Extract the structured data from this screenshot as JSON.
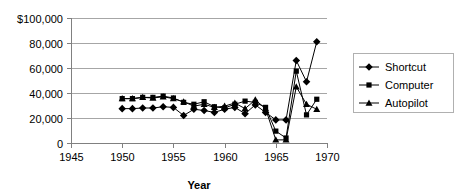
{
  "chart_data": {
    "type": "line",
    "title": "",
    "xlabel": "Year",
    "ylabel": "",
    "xlim": [
      1945,
      1970
    ],
    "ylim": [
      0,
      100000
    ],
    "grid": true,
    "legend_position": "right",
    "x": [
      1950,
      1951,
      1952,
      1953,
      1954,
      1955,
      1956,
      1957,
      1958,
      1959,
      1960,
      1961,
      1962,
      1963,
      1964,
      1965,
      1966,
      1967,
      1968,
      1969
    ],
    "xtick_labels": [
      "1945",
      "1950",
      "1955",
      "1960",
      "1965",
      "1970"
    ],
    "xtick_values": [
      1945,
      1950,
      1955,
      1960,
      1965,
      1970
    ],
    "ytick_labels": [
      "$100,000",
      "80,000",
      "60,000",
      "40,000",
      "20,000",
      "0"
    ],
    "ytick_values": [
      100000,
      80000,
      60000,
      40000,
      20000,
      0
    ],
    "series": [
      {
        "name": "Shortcut",
        "marker": "diamond",
        "values": [
          27500,
          27500,
          28000,
          28000,
          29000,
          28500,
          22000,
          27000,
          26000,
          24500,
          27000,
          28500,
          23500,
          30500,
          24500,
          18500,
          18500,
          66000,
          49000,
          81000
        ]
      },
      {
        "name": "Computer",
        "marker": "square",
        "values": [
          35500,
          35500,
          36500,
          36500,
          37500,
          36000,
          32500,
          31000,
          33000,
          29000,
          28000,
          31000,
          33500,
          32500,
          28500,
          9500,
          4000,
          57500,
          22500,
          35000
        ]
      },
      {
        "name": "Autopilot",
        "marker": "triangle",
        "values": [
          35500,
          35500,
          36500,
          36000,
          37000,
          35500,
          33000,
          29500,
          31000,
          28500,
          29500,
          32000,
          27500,
          34500,
          27500,
          2500,
          2500,
          45000,
          31000,
          27000
        ]
      }
    ]
  },
  "legend": {
    "entries": [
      {
        "label": "Shortcut"
      },
      {
        "label": "Computer"
      },
      {
        "label": "Autopilot"
      }
    ]
  },
  "colors": {
    "gridline": "#a6a6a6",
    "axis": "#808080",
    "series": "#000000",
    "legend_border": "#b0b0b0",
    "background": "#ffffff"
  }
}
